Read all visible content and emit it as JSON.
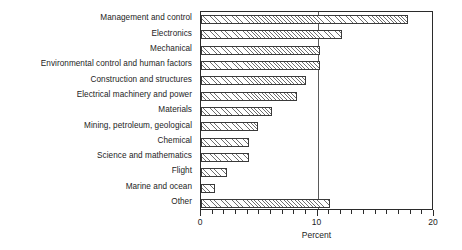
{
  "chart_data": {
    "type": "bar",
    "orientation": "horizontal",
    "title": "",
    "xlabel": "Percent",
    "ylabel": "",
    "xlim": [
      0,
      20
    ],
    "xticks": [
      0,
      10,
      20
    ],
    "xtick_labels": [
      "0",
      "10",
      "20"
    ],
    "minor_tick_step": 1,
    "grid": "single vertical gridline at 10",
    "legend": "none",
    "categories": [
      "Management and control",
      "Electronics",
      "Mechanical",
      "Environmental control and human factors",
      "Construction and structures",
      "Electrical machinery and power",
      "Materials",
      "Mining, petroleum, geological",
      "Chemical",
      "Science and mathematics",
      "Flight",
      "Marine and ocean",
      "Other"
    ],
    "values": [
      17.8,
      12.1,
      10.2,
      10.2,
      9.0,
      8.2,
      6.1,
      4.9,
      4.1,
      4.1,
      2.2,
      1.2,
      11.1
    ],
    "bar_fill": "diagonal-hatch",
    "bar_edge_color": "#3a3a3a",
    "background_color": "#ffffff"
  },
  "axis": {
    "x_title": "Percent",
    "tick_labels": [
      "0",
      "10",
      "20"
    ]
  }
}
